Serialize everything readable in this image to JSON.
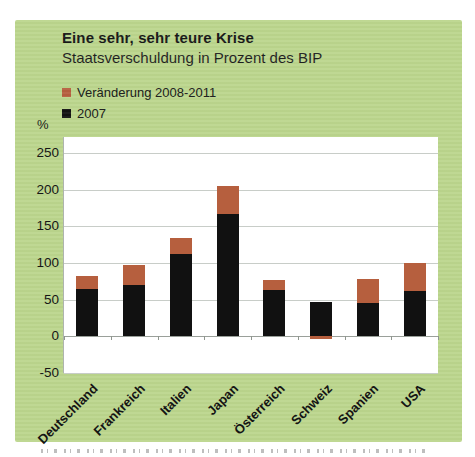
{
  "panel": {
    "title": "Eine sehr, sehr teure Krise",
    "subtitle": "Staatsverschuldung in Prozent des BIP"
  },
  "axis": {
    "unit_label": "%"
  },
  "legend": [
    {
      "label": "Veränderung 2008-2011",
      "color": "#b65f3e"
    },
    {
      "label": "2007",
      "color": "#111111"
    }
  ],
  "colors": {
    "panel_background": "#bcd68d",
    "plot_background": "#ffffff",
    "gridline": "#c8cdc8",
    "zero_line": "#9aa09a",
    "bar_2007": "#111111",
    "bar_change": "#b65f3e"
  },
  "chart_data": {
    "type": "bar",
    "stacked": true,
    "title": "Eine sehr, sehr teure Krise",
    "subtitle": "Staatsverschuldung in Prozent des BIP",
    "unit": "%",
    "categories": [
      "Deutschland",
      "Frankreich",
      "Italien",
      "Japan",
      "Österreich",
      "Schweiz",
      "Spanien",
      "USA"
    ],
    "series": [
      {
        "name": "2007",
        "color": "#111111",
        "values": [
          65,
          70,
          113,
          167,
          63,
          47,
          45,
          62
        ]
      },
      {
        "name": "Veränderung 2008-2011",
        "color": "#b65f3e",
        "values": [
          17,
          27,
          21,
          38,
          14,
          -3,
          33,
          38
        ]
      }
    ],
    "totals_2011": [
      82,
      97,
      134,
      205,
      77,
      44,
      78,
      100
    ],
    "ylabel": "%",
    "yticks": [
      -50,
      0,
      50,
      100,
      150,
      200,
      250
    ],
    "ylim": [
      -50,
      272
    ],
    "grid": true,
    "legend_position": "top-left"
  }
}
